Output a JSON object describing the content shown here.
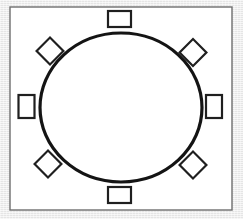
{
  "diagram": {
    "canvas": {
      "width": 243,
      "height": 219
    },
    "background_color": "#ececec",
    "paper_color": "#ffffff",
    "ink_color": "#1a1a1a",
    "frame": {
      "label": "room-outline",
      "x": 10,
      "y": 7,
      "width": 222,
      "height": 203,
      "stroke": "#6e6e6e",
      "stroke_width": 1.4,
      "fill": "#ffffff"
    },
    "table": {
      "label": "round-table",
      "shape": "ellipse",
      "cx": 121,
      "cy": 107.5,
      "rx": 81,
      "ry": 74.5,
      "stroke": "#141414",
      "stroke_width": 3.2,
      "fill": "#ffffff"
    },
    "seat_style": {
      "stroke": "#1f1f1f",
      "stroke_width": 2.2,
      "fill": "#ffffff"
    },
    "seat_count": 8,
    "seats": [
      {
        "name": "seat-north",
        "position": "top",
        "shape": "rectangle",
        "cx": 119.5,
        "cy": 19,
        "width": 23,
        "height": 16,
        "rotation": 0
      },
      {
        "name": "seat-northeast",
        "position": "top-right",
        "shape": "diamond",
        "cx": 193,
        "cy": 52.5,
        "width": 19,
        "height": 19,
        "rotation": 45
      },
      {
        "name": "seat-east",
        "position": "right",
        "shape": "rectangle",
        "cx": 214,
        "cy": 106.5,
        "width": 16,
        "height": 23,
        "rotation": 0
      },
      {
        "name": "seat-southeast",
        "position": "bottom-right",
        "shape": "diamond",
        "cx": 193,
        "cy": 165,
        "width": 19,
        "height": 19,
        "rotation": 45
      },
      {
        "name": "seat-south",
        "position": "bottom",
        "shape": "rectangle",
        "cx": 119.5,
        "cy": 195,
        "width": 23,
        "height": 16,
        "rotation": 0
      },
      {
        "name": "seat-southwest",
        "position": "bottom-left",
        "shape": "diamond",
        "cx": 48,
        "cy": 164,
        "width": 19,
        "height": 19,
        "rotation": 45
      },
      {
        "name": "seat-west",
        "position": "left",
        "shape": "rectangle",
        "cx": 26.5,
        "cy": 106.5,
        "width": 16,
        "height": 23,
        "rotation": 0
      },
      {
        "name": "seat-northwest",
        "position": "top-left",
        "shape": "diamond",
        "cx": 50,
        "cy": 51,
        "width": 19,
        "height": 19,
        "rotation": 45
      }
    ]
  }
}
